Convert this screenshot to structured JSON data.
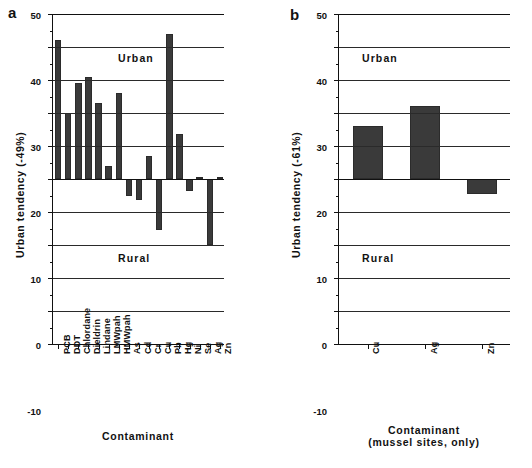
{
  "figure": {
    "panels": [
      {
        "letter": "a",
        "ylabel": "Urban tendency (-49%)",
        "xlabel_line1": "Contaminant",
        "xlabel_line2": "",
        "upper_region": "Urban",
        "lower_region": "Rural"
      },
      {
        "letter": "b",
        "ylabel": "Urban tendency (-61%)",
        "xlabel_line1": "Contaminant",
        "xlabel_line2": "(mussel sites, only)",
        "upper_region": "Urban",
        "lower_region": "Rural"
      }
    ]
  },
  "chart_data": [
    {
      "type": "bar",
      "title": "a",
      "xlabel": "Contaminant",
      "ylabel": "Urban tendency (-49%)",
      "ylim": [
        -50,
        50
      ],
      "yticks": [
        50,
        40,
        30,
        20,
        10,
        0,
        -10,
        -20,
        -30,
        -40,
        -50
      ],
      "grid": true,
      "legend": false,
      "annotations": [
        "Urban",
        "Rural"
      ],
      "categories": [
        "PCB",
        "DDT",
        "Chlordane",
        "Dieldrin",
        "Lindane",
        "LMWpah",
        "HMWpah",
        "As",
        "Cd",
        "Cr",
        "Cu",
        "Pb",
        "Hg",
        "Ni",
        "Se",
        "Ag",
        "Zn"
      ],
      "values": [
        42,
        20,
        29,
        31,
        23,
        4,
        26,
        -5,
        -6.5,
        7,
        -15.5,
        44,
        13.5,
        -3.5,
        0.5,
        -20,
        0.5
      ]
    },
    {
      "type": "bar",
      "title": "b",
      "xlabel": "Contaminant (mussel sites, only)",
      "ylabel": "Urban tendency (-61%)",
      "ylim": [
        -50,
        50
      ],
      "yticks": [
        50,
        40,
        30,
        20,
        10,
        0,
        -10,
        -20,
        -30,
        -40,
        -50
      ],
      "grid": true,
      "legend": false,
      "annotations": [
        "Urban",
        "Rural"
      ],
      "categories": [
        "Cu",
        "Ag",
        "Zn"
      ],
      "values": [
        16,
        22,
        -4.5
      ]
    }
  ]
}
